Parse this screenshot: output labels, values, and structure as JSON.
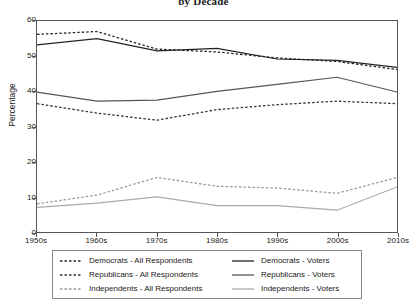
{
  "chart_data": {
    "type": "line",
    "title": "by Decade",
    "xlabel": "",
    "ylabel": "Percentage",
    "categories": [
      "1950s",
      "1960s",
      "1970s",
      "1980s",
      "1990s",
      "2000s",
      "2010s"
    ],
    "ylim": [
      0,
      60
    ],
    "yticks": [
      0,
      10,
      20,
      30,
      40,
      50,
      60
    ],
    "grid": false,
    "legend_position": "below-outside",
    "series": [
      {
        "name": "Democrats - All Respondents",
        "style": "dashed",
        "color": "#222222",
        "values": [
          56.2,
          57.0,
          52.0,
          51.2,
          49.5,
          48.5,
          46.2
        ]
      },
      {
        "name": "Republicans - All Respondents",
        "style": "dashed",
        "color": "#333333",
        "values": [
          36.5,
          33.8,
          31.8,
          34.8,
          36.2,
          37.2,
          36.5
        ]
      },
      {
        "name": "Independents - All Respondents",
        "style": "dashed",
        "color": "#999999",
        "values": [
          8.0,
          10.5,
          15.5,
          13.0,
          12.5,
          11.0,
          15.5
        ]
      },
      {
        "name": "Democrats - Voters",
        "style": "solid",
        "color": "#222222",
        "values": [
          53.2,
          55.0,
          51.5,
          52.2,
          49.2,
          48.8,
          46.8
        ]
      },
      {
        "name": "Republicans - Voters",
        "style": "solid",
        "color": "#555555",
        "values": [
          39.8,
          37.2,
          37.5,
          40.0,
          42.0,
          44.0,
          39.8
        ]
      },
      {
        "name": "Independents - Voters",
        "style": "solid",
        "color": "#aaaaaa",
        "values": [
          7.0,
          8.2,
          10.0,
          7.5,
          7.5,
          6.2,
          12.8
        ]
      }
    ]
  }
}
